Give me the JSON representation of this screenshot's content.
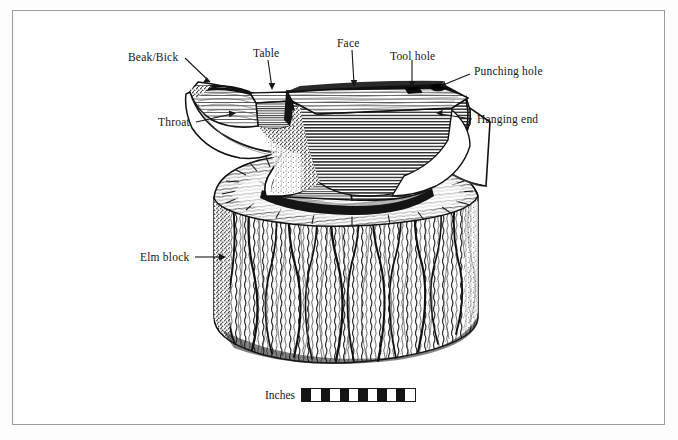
{
  "figure": {
    "caption_faint": "",
    "frame_color": "#9b9b9b",
    "ink_color": "#161616"
  },
  "labels": [
    {
      "id": "beak-bick",
      "text": "Beak/Bick",
      "x": 128,
      "y": 51
    },
    {
      "id": "table",
      "text": "Table",
      "x": 253,
      "y": 47
    },
    {
      "id": "face",
      "text": "Face",
      "x": 337,
      "y": 37
    },
    {
      "id": "tool-hole",
      "text": "Tool hole",
      "x": 390,
      "y": 50
    },
    {
      "id": "punching-hole",
      "text": "Punching hole",
      "x": 474,
      "y": 68
    },
    {
      "id": "throat",
      "text": "Throat",
      "x": 158,
      "y": 118
    },
    {
      "id": "hanging-end",
      "text": "Hanging end",
      "x": 477,
      "y": 115
    },
    {
      "id": "elm-block",
      "text": "Elm block",
      "x": 140,
      "y": 253
    }
  ],
  "scale": {
    "unit_label": "Inches",
    "segments": 12,
    "dark_color": "#141414",
    "light_color": "#ffffff",
    "border_color": "#1a1a1a"
  }
}
